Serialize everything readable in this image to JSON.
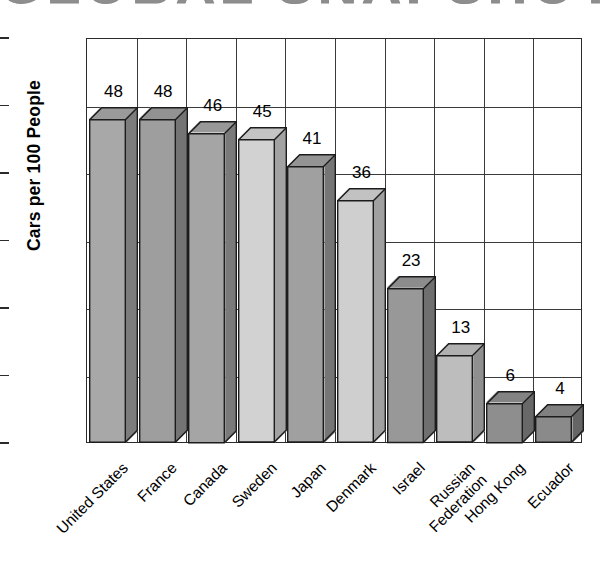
{
  "chart_data": {
    "type": "bar",
    "title": "GLOBAL SNAPSHOT",
    "xlabel": "",
    "ylabel": "Cars per 100 People",
    "ylim": [
      0,
      60
    ],
    "ytick_step": 10,
    "yticks": [
      "60",
      "50",
      "40",
      "30",
      "20",
      "10",
      "0"
    ],
    "grid": "both",
    "legend": "none",
    "style": "3d-bars-grayscale-print",
    "categories": [
      "United States",
      "France",
      "Canada",
      "Sweden",
      "Japan",
      "Denmark",
      "Israel",
      "Russian Federation",
      "Hong Kong",
      "Ecuador"
    ],
    "category_lines": [
      [
        "United States"
      ],
      [
        "France"
      ],
      [
        "Canada"
      ],
      [
        "Sweden"
      ],
      [
        "Japan"
      ],
      [
        "Denmark"
      ],
      [
        "Israel"
      ],
      [
        "Russian",
        "Federation"
      ],
      [
        "Hong Kong"
      ],
      [
        "Ecuador"
      ]
    ],
    "values": [
      48,
      48,
      46,
      45,
      41,
      36,
      23,
      13,
      6,
      4
    ],
    "value_labels": [
      "48",
      "48",
      "46",
      "45",
      "41",
      "36",
      "23",
      "13",
      "6",
      "4"
    ],
    "bar_colors": [
      {
        "front": "#a8a8a8",
        "top": "#9a9a9a",
        "side": "#7c7c7c"
      },
      {
        "front": "#9e9e9e",
        "top": "#929292",
        "side": "#747474"
      },
      {
        "front": "#a5a5a5",
        "top": "#989898",
        "side": "#7a7a7a"
      },
      {
        "front": "#d2d2d2",
        "top": "#c4c4c4",
        "side": "#a2a2a2"
      },
      {
        "front": "#a0a0a0",
        "top": "#949494",
        "side": "#767676"
      },
      {
        "front": "#cfcfcf",
        "top": "#c2c2c2",
        "side": "#a0a0a0"
      },
      {
        "front": "#989898",
        "top": "#8c8c8c",
        "side": "#6f6f6f"
      },
      {
        "front": "#bdbdbd",
        "top": "#b0b0b0",
        "side": "#8f8f8f"
      },
      {
        "front": "#8e8e8e",
        "top": "#838383",
        "side": "#686868"
      },
      {
        "front": "#8a8a8a",
        "top": "#808080",
        "side": "#656565"
      }
    ]
  },
  "colors": {
    "axis": "#2b2b2b",
    "grid": "#3a3a3a",
    "text": "#000000",
    "title": "#8e8e8e",
    "background": "#ffffff"
  }
}
